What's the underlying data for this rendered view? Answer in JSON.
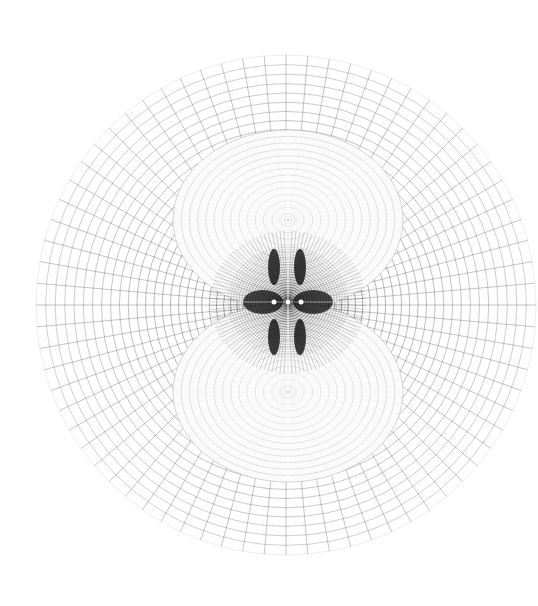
{
  "figure": {
    "type": "polar-mesh",
    "background": "#ffffff",
    "line_color": "#2a2a2a",
    "center": [
      286,
      305
    ],
    "outer_radius": 250,
    "inner_mesh_radius": 18,
    "radial_lines": 72,
    "rings": 30,
    "lobes": [
      {
        "name": "upper-lobe",
        "cx": 288,
        "cy": 220,
        "rx": 115,
        "ry": 90
      },
      {
        "name": "lower-lobe",
        "cx": 288,
        "cy": 392,
        "rx": 115,
        "ry": 90
      }
    ],
    "core": {
      "cx": 288,
      "cy": 302,
      "rx": 60,
      "ry": 55,
      "color": "#000000"
    },
    "markers": [
      [
        274,
        302
      ],
      [
        288,
        302
      ],
      [
        301,
        302
      ]
    ]
  }
}
